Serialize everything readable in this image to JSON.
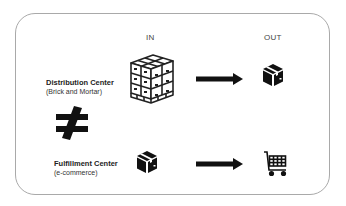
{
  "columns": {
    "in_label": "IN",
    "out_label": "OUT"
  },
  "rows": [
    {
      "title": "Distribution Center",
      "subtitle": "(Brick and Mortar)",
      "in_icon": "pallet-of-boxes-icon",
      "out_icon": "box-icon"
    },
    {
      "title": "Fulfillment Center",
      "subtitle": "(e-commerce)",
      "in_icon": "box-icon",
      "out_icon": "shopping-cart-icon"
    }
  ],
  "comparison_symbol": "not-equal-icon",
  "colors": {
    "icon": "#111111",
    "border": "#a9a9a9",
    "background": "#ffffff"
  }
}
